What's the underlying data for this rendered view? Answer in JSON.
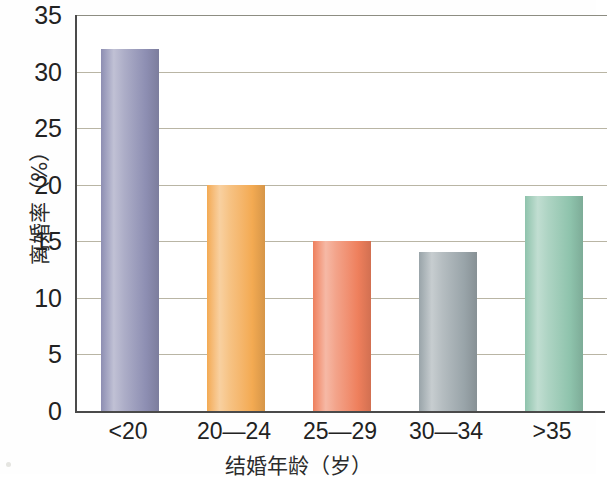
{
  "chart_data": {
    "type": "bar",
    "title": "",
    "xlabel": "结婚年龄（岁）",
    "ylabel": "离婚率（%）",
    "categories": [
      "<20",
      "20—24",
      "25—29",
      "30—34",
      ">35"
    ],
    "values": [
      32,
      20,
      15,
      14,
      19
    ],
    "series": [
      {
        "name": "离婚率",
        "values": [
          32,
          20,
          15,
          14,
          19
        ]
      }
    ],
    "ylim": [
      0,
      35
    ],
    "yticks": [
      0,
      5,
      10,
      15,
      20,
      25,
      30,
      35
    ],
    "ytick_labels": [
      "0",
      "5",
      "10",
      "15",
      "20",
      "25",
      "30",
      "35"
    ],
    "grid": "horizontal",
    "legend": "none",
    "bar_colors": [
      "#8d8eb2",
      "#f3aa52",
      "#ee7f5c",
      "#99a4a9",
      "#8ec3ac"
    ],
    "axis_color": "#4a4a4a",
    "gridline_color": "#b9b5a4",
    "background_color": "#ffffff"
  }
}
